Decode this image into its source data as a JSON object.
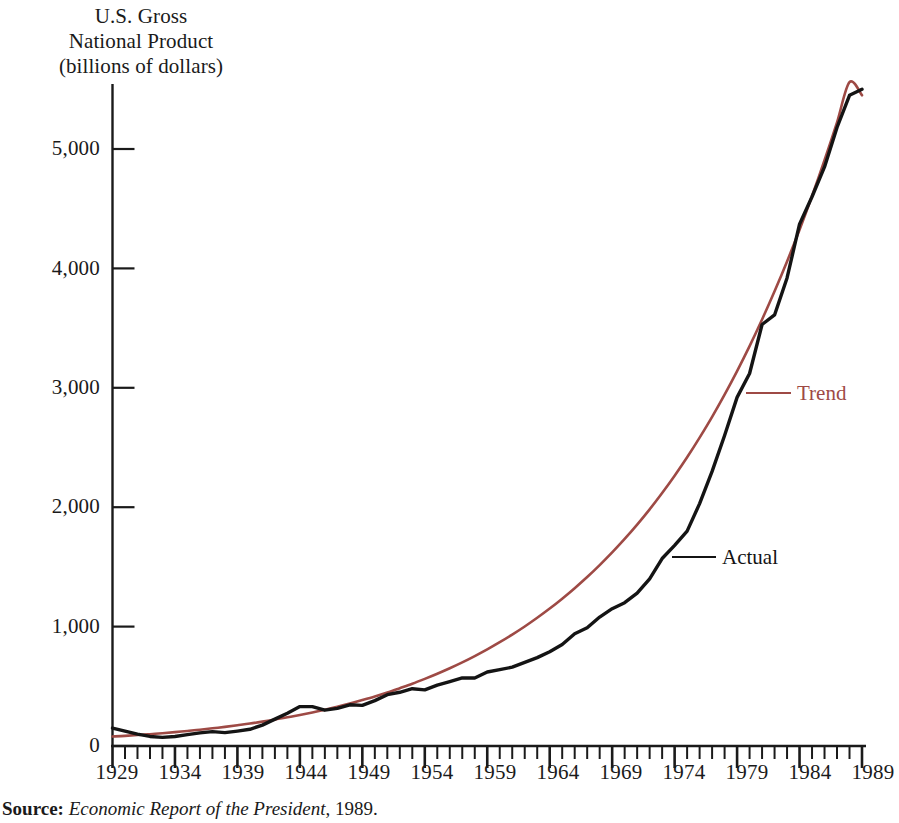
{
  "axis_title": {
    "line1": "U.S. Gross",
    "line2": "National Product",
    "line3": "(billions of dollars)"
  },
  "labels": {
    "trend": "Trend",
    "actual": "Actual"
  },
  "source": {
    "key": "Source:",
    "title": "Economic Report of the President",
    "year": ", 1989."
  },
  "colors": {
    "trend": "#9e4a45",
    "actual": "#141414",
    "axis": "#1a1a1a",
    "background": "#ffffff"
  },
  "chart_data": {
    "type": "line",
    "title": "U.S. Gross National Product (billions of dollars)",
    "xlabel": "",
    "ylabel": "U.S. Gross National Product (billions of dollars)",
    "xlim": [
      1929,
      1989
    ],
    "ylim": [
      0,
      5500
    ],
    "yticks": [
      0,
      1000,
      2000,
      3000,
      4000,
      5000
    ],
    "ytick_labels": [
      "0",
      "1,000",
      "2,000",
      "3,000",
      "4,000",
      "5,000"
    ],
    "xticks": [
      1929,
      1934,
      1939,
      1944,
      1949,
      1954,
      1959,
      1964,
      1969,
      1974,
      1979,
      1984,
      1989
    ],
    "xtick_labels": [
      "1929",
      "1934",
      "1939",
      "1944",
      "1949",
      "1954",
      "1959",
      "1964",
      "1969",
      "1974",
      "1979",
      "1984",
      "1989"
    ],
    "minor_xtick_interval": 1,
    "grid": false,
    "legend": "inline-callout",
    "x": [
      1929,
      1930,
      1931,
      1932,
      1933,
      1934,
      1935,
      1936,
      1937,
      1938,
      1939,
      1940,
      1941,
      1942,
      1943,
      1944,
      1945,
      1946,
      1947,
      1948,
      1949,
      1950,
      1951,
      1952,
      1953,
      1954,
      1955,
      1956,
      1957,
      1958,
      1959,
      1960,
      1961,
      1962,
      1963,
      1964,
      1965,
      1966,
      1967,
      1968,
      1969,
      1970,
      1971,
      1972,
      1973,
      1974,
      1975,
      1976,
      1977,
      1978,
      1979,
      1980,
      1981,
      1982,
      1983,
      1984,
      1985,
      1986,
      1987,
      1988,
      1989
    ],
    "series": [
      {
        "name": "Actual",
        "color": "#141414",
        "values": [
          150,
          125,
          100,
          80,
          72,
          80,
          95,
          110,
          120,
          112,
          125,
          140,
          175,
          225,
          275,
          330,
          330,
          300,
          315,
          345,
          340,
          380,
          430,
          450,
          480,
          470,
          510,
          540,
          570,
          570,
          620,
          640,
          660,
          700,
          740,
          790,
          850,
          940,
          990,
          1080,
          1150,
          1200,
          1280,
          1400,
          1570,
          1680,
          1800,
          2030,
          2300,
          2600,
          2920,
          3120,
          3530,
          3610,
          3920,
          4370,
          4600,
          4850,
          5180,
          5450,
          5500
        ]
      },
      {
        "name": "Trend",
        "color": "#9e4a45",
        "values": [
          80,
          85,
          92,
          99,
          107,
          116,
          126,
          136,
          148,
          160,
          174,
          188,
          204,
          221,
          240,
          260,
          281,
          304,
          329,
          356,
          385,
          415,
          448,
          484,
          521,
          562,
          605,
          651,
          700,
          753,
          809,
          869,
          933,
          1001,
          1074,
          1151,
          1234,
          1322,
          1415,
          1515,
          1621,
          1734,
          1854,
          1982,
          2119,
          2264,
          2418,
          2583,
          2757,
          2943,
          3140,
          3349,
          3572,
          3808,
          4058,
          4324,
          4606,
          4906,
          5223,
          5560,
          5450
        ]
      }
    ]
  }
}
